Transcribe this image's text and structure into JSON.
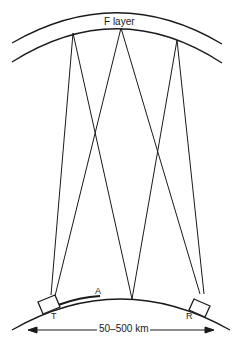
{
  "diagram": {
    "layer_label": "F layer",
    "transmitter_label": "T",
    "receiver_label": "R",
    "point_label": "A",
    "distance_label": "50–500 km",
    "colors": {
      "line": "#1a1a1a",
      "background": "#ffffff"
    },
    "reflection_points_top": [
      [
        73,
        33
      ],
      [
        121,
        28
      ],
      [
        177,
        40
      ]
    ],
    "ground_point": [
      132,
      299
    ],
    "transmitter_pos": [
      48,
      300
    ],
    "receiver_pos": [
      201,
      300
    ]
  }
}
